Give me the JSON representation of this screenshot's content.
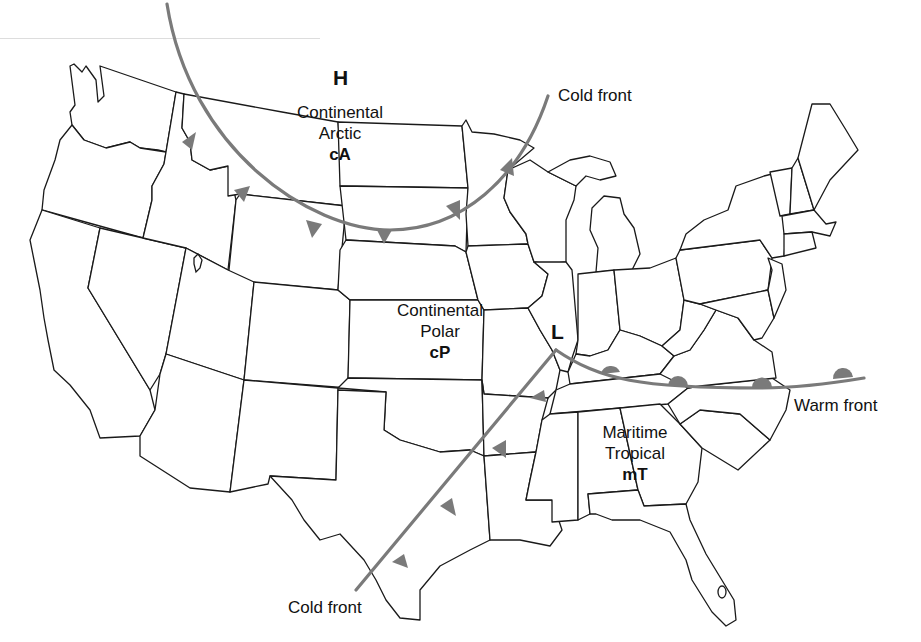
{
  "map": {
    "title": "",
    "region": "Contiguous United States",
    "colors": {
      "state_outline": "#1a1a1a",
      "front": "#7a7a7a",
      "background": "#ffffff",
      "text": "#111111"
    },
    "pressure_centers": [
      {
        "symbol": "H",
        "meaning": "high"
      },
      {
        "symbol": "L",
        "meaning": "low"
      }
    ],
    "air_masses": [
      {
        "name_line1": "Continental",
        "name_line2": "Arctic",
        "code": "cA"
      },
      {
        "name_line1": "Continental",
        "name_line2": "Polar",
        "code": "cP"
      },
      {
        "name_line1": "Maritime",
        "name_line2": "Tropical",
        "code": "mT"
      }
    ],
    "fronts": [
      {
        "label": "Cold front",
        "type": "cold",
        "symbol": "triangle"
      },
      {
        "label": "Warm front",
        "type": "warm",
        "symbol": "semicircle"
      },
      {
        "label": "Cold front",
        "type": "cold",
        "symbol": "triangle"
      }
    ]
  }
}
